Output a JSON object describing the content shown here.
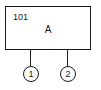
{
  "diagram": {
    "block": {
      "id": "101",
      "label": "A"
    },
    "ports": [
      {
        "number": "1"
      },
      {
        "number": "2"
      }
    ],
    "colors": {
      "stroke": "#1a1a1a",
      "background": "#ffffff"
    }
  }
}
